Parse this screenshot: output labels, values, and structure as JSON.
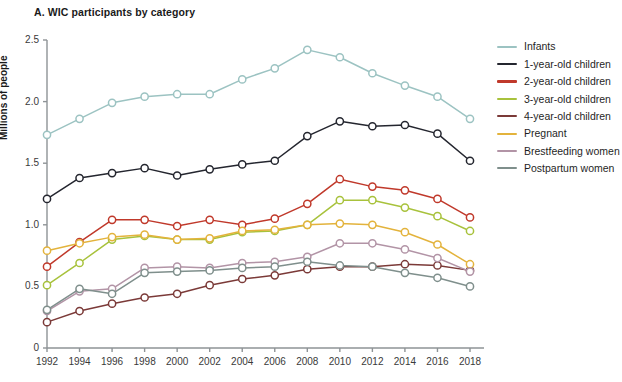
{
  "chart_data": {
    "type": "line",
    "title": "A. WIC participants by category",
    "xlabel": "",
    "ylabel": "Millions of people",
    "x": [
      1992,
      1994,
      1996,
      1998,
      2000,
      2002,
      2004,
      2006,
      2008,
      2010,
      2012,
      2014,
      2016,
      2018
    ],
    "xtick_labels": [
      "1992",
      "1994",
      "1996",
      "1998",
      "2000",
      "2002",
      "2004",
      "2006",
      "2008",
      "2010",
      "2012",
      "2014",
      "2016",
      "2018"
    ],
    "ytick_labels": [
      "0",
      "0.5",
      "1.0",
      "1.5",
      "2.0",
      "2.5"
    ],
    "ytick_values": [
      0,
      0.5,
      1.0,
      1.5,
      2.0,
      2.5
    ],
    "xlim": [
      1992,
      2018
    ],
    "ylim": [
      0,
      2.5
    ],
    "grid": false,
    "legend_position": "right",
    "markers": "open-circle",
    "series": [
      {
        "name": "Infants",
        "color": "#9cc3c2",
        "values": [
          1.73,
          1.86,
          1.99,
          2.04,
          2.06,
          2.06,
          2.18,
          2.27,
          2.42,
          2.36,
          2.23,
          2.13,
          2.04,
          1.86
        ]
      },
      {
        "name": "1-year-old children",
        "color": "#24262f",
        "values": [
          1.21,
          1.38,
          1.42,
          1.46,
          1.4,
          1.45,
          1.49,
          1.52,
          1.72,
          1.84,
          1.8,
          1.81,
          1.74,
          1.52
        ]
      },
      {
        "name": "2-year-old children",
        "color": "#c0392b",
        "values": [
          0.66,
          0.86,
          1.04,
          1.04,
          0.99,
          1.04,
          1.0,
          1.05,
          1.17,
          1.37,
          1.31,
          1.28,
          1.21,
          1.06
        ]
      },
      {
        "name": "3-year-old children",
        "color": "#a8c23c",
        "values": [
          0.51,
          0.69,
          0.88,
          0.91,
          0.88,
          0.88,
          0.94,
          0.95,
          1.0,
          1.2,
          1.2,
          1.14,
          1.07,
          0.95
        ]
      },
      {
        "name": "4-year-old children",
        "color": "#7b3a38",
        "values": [
          0.21,
          0.3,
          0.36,
          0.41,
          0.44,
          0.51,
          0.56,
          0.59,
          0.64,
          0.66,
          0.66,
          0.68,
          0.67,
          0.63
        ]
      },
      {
        "name": "Pregnant",
        "color": "#e3b33c",
        "values": [
          0.79,
          0.85,
          0.9,
          0.92,
          0.88,
          0.89,
          0.95,
          0.96,
          1.0,
          1.01,
          1.0,
          0.94,
          0.84,
          0.68
        ]
      },
      {
        "name": "Brestfeeding women",
        "color": "#b294a6",
        "values": [
          0.3,
          0.46,
          0.48,
          0.65,
          0.66,
          0.65,
          0.69,
          0.7,
          0.74,
          0.85,
          0.85,
          0.8,
          0.73,
          0.62
        ]
      },
      {
        "name": "Postpartum women",
        "color": "#7f8f8c",
        "values": [
          0.31,
          0.48,
          0.44,
          0.61,
          0.62,
          0.63,
          0.65,
          0.66,
          0.7,
          0.67,
          0.66,
          0.61,
          0.57,
          0.5
        ]
      }
    ]
  }
}
